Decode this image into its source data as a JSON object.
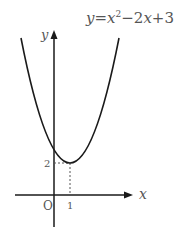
{
  "diagram": {
    "equation": {
      "lhs": "y",
      "eq": "=",
      "x": "x",
      "exp": "2",
      "rest": "−2",
      "x2": "x",
      "plus": "+3"
    },
    "axes": {
      "x_label": "x",
      "y_label": "y",
      "origin_label": "O"
    },
    "ticks": {
      "x_tick": "1",
      "y_tick": "2"
    },
    "vertex": {
      "x": 1,
      "y": 2
    },
    "colors": {
      "curve": "#1a1a1a",
      "axis": "#1a1a1a",
      "text": "#555555",
      "dashed": "#555555"
    }
  }
}
